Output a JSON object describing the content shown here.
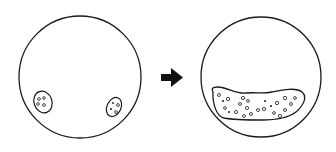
{
  "diagram": {
    "stroke_color": "#1a1a1a",
    "background": "#ffffff",
    "left_dish": {
      "label": "",
      "clusters": 2
    },
    "arrow": {
      "icon": "right-arrow-icon",
      "color": "#111111"
    },
    "right_dish": {
      "label": "",
      "clusters": 1
    }
  }
}
